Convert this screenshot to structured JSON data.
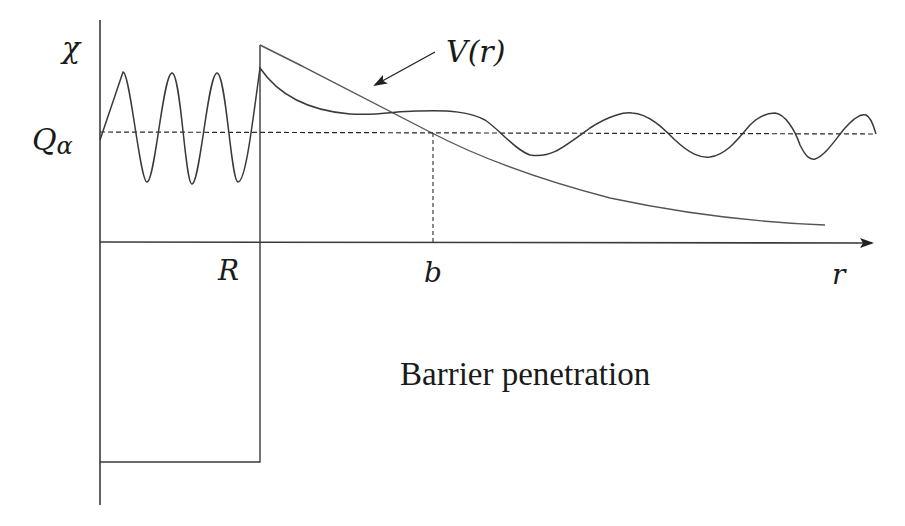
{
  "diagram": {
    "title": "Barrier penetration",
    "labels": {
      "y_axis": "χ",
      "energy_level": "Q",
      "energy_level_sub": "α",
      "nuclear_radius": "R",
      "turning_point": "b",
      "x_axis": "r",
      "potential": "V(r)"
    },
    "colors": {
      "line": "#3a3a3a",
      "potential": "#555555",
      "text": "#1a1a1a",
      "background": "#ffffff"
    },
    "elements": [
      "vertical axis",
      "horizontal r axis with arrow",
      "square well (depth below r axis) from 0 to R",
      "Coulomb potential V(r) decaying beyond R",
      "dashed energy level Q_alpha",
      "dashed vertical marker at turning point b",
      "wavefunction: fast oscillation inside well, decaying inside barrier, slower oscillation outside"
    ]
  }
}
